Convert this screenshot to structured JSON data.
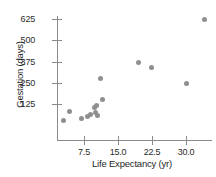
{
  "chart_data": {
    "type": "scatter",
    "title": "",
    "xlabel": "Life Expectancy (yr)",
    "ylabel": "Gestation (days)",
    "xlim": [
      1.5,
      35.5
    ],
    "ylim": [
      0,
      680
    ],
    "xticks": [
      "7.5",
      "15.0",
      "22.5",
      "30.0"
    ],
    "xtick_values": [
      7.5,
      15.0,
      22.5,
      30.0
    ],
    "yticks": [
      "125",
      "250",
      "375",
      "500",
      "625"
    ],
    "ytick_values": [
      125,
      250,
      375,
      500,
      625
    ],
    "grid": false,
    "legend": false,
    "marker_color": "#8f8f8f",
    "axis_color": "#8a8a8a",
    "points": [
      {
        "x": 3.0,
        "y": 30
      },
      {
        "x": 4.2,
        "y": 80
      },
      {
        "x": 7.0,
        "y": 40
      },
      {
        "x": 8.3,
        "y": 52
      },
      {
        "x": 8.8,
        "y": 63
      },
      {
        "x": 9.8,
        "y": 105
      },
      {
        "x": 9.9,
        "y": 75
      },
      {
        "x": 10.2,
        "y": 115
      },
      {
        "x": 10.4,
        "y": 60
      },
      {
        "x": 11.0,
        "y": 275
      },
      {
        "x": 11.6,
        "y": 150
      },
      {
        "x": 19.5,
        "y": 370
      },
      {
        "x": 22.4,
        "y": 340
      },
      {
        "x": 30.0,
        "y": 245
      },
      {
        "x": 34.0,
        "y": 625
      }
    ]
  }
}
